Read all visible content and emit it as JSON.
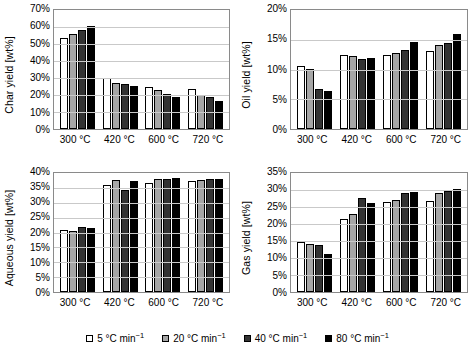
{
  "chart_data": [
    {
      "type": "bar",
      "panel": "top-left",
      "title": "",
      "ylabel": "Char yield [wt%]",
      "xlabel": "",
      "categories": [
        "300 °C",
        "420 °C",
        "600 °C",
        "720 °C"
      ],
      "ylim": [
        0,
        70
      ],
      "ytick_step": 5,
      "yticks": [
        "0%",
        "10%",
        "20%",
        "30%",
        "40%",
        "50%",
        "60%",
        "70%"
      ],
      "ytick_values": [
        0,
        10,
        20,
        30,
        40,
        50,
        60,
        70
      ],
      "grid": true,
      "legend_position": "bottom-shared",
      "series": [
        {
          "name": "5 °C min-1",
          "values": [
            53.7,
            29.8,
            24.9,
            23.4
          ]
        },
        {
          "name": "20 °C min-1",
          "values": [
            55.6,
            27.2,
            22.7,
            20.0
          ]
        },
        {
          "name": "40 °C min-1",
          "values": [
            58.0,
            26.4,
            20.8,
            18.9
          ]
        },
        {
          "name": "80 °C min-1",
          "values": [
            60.7,
            25.3,
            19.1,
            16.4
          ]
        }
      ]
    },
    {
      "type": "bar",
      "panel": "top-right",
      "title": "",
      "ylabel": "Oil yield [wt%]",
      "xlabel": "",
      "categories": [
        "300 °C",
        "420 °C",
        "600 °C",
        "720 °C"
      ],
      "ylim": [
        0,
        20
      ],
      "ytick_step": 5,
      "yticks": [
        "0%",
        "5%",
        "10%",
        "15%",
        "20%"
      ],
      "ytick_values": [
        0,
        5,
        10,
        15,
        20
      ],
      "grid": true,
      "legend_position": "bottom-shared",
      "series": [
        {
          "name": "5 °C min-1",
          "values": [
            10.6,
            12.4,
            12.5,
            13.1
          ]
        },
        {
          "name": "20 °C min-1",
          "values": [
            10.1,
            12.2,
            12.8,
            14.2
          ]
        },
        {
          "name": "40 °C min-1",
          "values": [
            6.7,
            11.8,
            13.3,
            14.4
          ]
        },
        {
          "name": "80 °C min-1",
          "values": [
            6.4,
            12.0,
            14.7,
            15.9
          ]
        }
      ]
    },
    {
      "type": "bar",
      "panel": "bottom-left",
      "title": "",
      "ylabel": "Aqueous yield [wt%]",
      "xlabel": "",
      "categories": [
        "300 °C",
        "420 °C",
        "600 °C",
        "720 °C"
      ],
      "ylim": [
        0,
        40
      ],
      "ytick_step": 5,
      "yticks": [
        "0%",
        "5%",
        "10%",
        "15%",
        "20%",
        "25%",
        "30%",
        "35%",
        "40%"
      ],
      "ytick_values": [
        0,
        5,
        10,
        15,
        20,
        25,
        30,
        35,
        40
      ],
      "grid": true,
      "legend_position": "bottom-shared",
      "series": [
        {
          "name": "5 °C min-1",
          "values": [
            20.9,
            36.0,
            36.8,
            37.3
          ]
        },
        {
          "name": "20 °C min-1",
          "values": [
            20.5,
            37.6,
            37.9,
            37.8
          ]
        },
        {
          "name": "40 °C min-1",
          "values": [
            21.8,
            34.2,
            38.1,
            38.1
          ]
        },
        {
          "name": "80 °C min-1",
          "values": [
            21.6,
            37.2,
            38.2,
            38.1
          ]
        }
      ]
    },
    {
      "type": "bar",
      "panel": "bottom-right",
      "title": "",
      "ylabel": "Gas yield [wt%]",
      "xlabel": "",
      "categories": [
        "300 °C",
        "420 °C",
        "600 °C",
        "720 °C"
      ],
      "ylim": [
        0,
        35
      ],
      "ytick_step": 5,
      "yticks": [
        "0%",
        "5%",
        "10%",
        "15%",
        "20%",
        "25%",
        "30%",
        "35%"
      ],
      "ytick_values": [
        0,
        5,
        10,
        15,
        20,
        25,
        30,
        35
      ],
      "grid": true,
      "legend_position": "bottom-shared",
      "series": [
        {
          "name": "5 °C min-1",
          "values": [
            14.7,
            21.5,
            26.5,
            26.9
          ]
        },
        {
          "name": "20 °C min-1",
          "values": [
            14.2,
            23.0,
            27.0,
            29.0
          ]
        },
        {
          "name": "40 °C min-1",
          "values": [
            13.7,
            27.7,
            29.0,
            29.7
          ]
        },
        {
          "name": "80 °C min-1",
          "values": [
            11.3,
            26.1,
            29.3,
            30.2
          ]
        }
      ]
    }
  ],
  "legend": {
    "items": [
      {
        "label_pre": "5 °C min",
        "sup": "−1",
        "color": "#ffffff"
      },
      {
        "label_pre": "20 °C min",
        "sup": "−1",
        "color": "#a6a6a6"
      },
      {
        "label_pre": "40 °C min",
        "sup": "−1",
        "color": "#333333"
      },
      {
        "label_pre": "80 °C min",
        "sup": "−1",
        "color": "#000000"
      }
    ]
  },
  "series_colors": [
    "#ffffff",
    "#a6a6a6",
    "#333333",
    "#000000"
  ]
}
